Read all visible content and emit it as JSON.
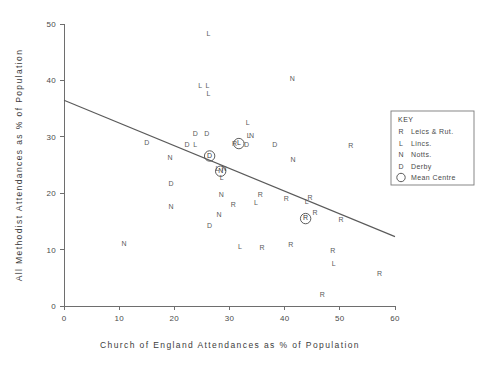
{
  "chart_data": {
    "type": "scatter",
    "title": "",
    "xlabel": "Church of England Attendances as % of Population",
    "ylabel": "All Methodist Attendances as % of Population",
    "xlim": [
      0,
      60
    ],
    "ylim": [
      0,
      50
    ],
    "xticks": [
      0,
      10,
      20,
      30,
      40,
      50,
      60
    ],
    "yticks": [
      0,
      10,
      20,
      30,
      40,
      50
    ],
    "grid": false,
    "legend_position": "right",
    "series": [
      {
        "name": "Leics & Rut.",
        "marker": "R",
        "points": [
          [
            30.9,
            28.7
          ],
          [
            52.0,
            28.3
          ],
          [
            35.6,
            19.6
          ],
          [
            40.3,
            19.0
          ],
          [
            44.6,
            19.1
          ],
          [
            30.7,
            17.8
          ],
          [
            45.5,
            16.4
          ],
          [
            50.2,
            15.2
          ],
          [
            41.1,
            10.8
          ],
          [
            35.9,
            10.2
          ],
          [
            48.7,
            9.8
          ],
          [
            57.2,
            5.6
          ],
          [
            46.8,
            1.9
          ]
        ]
      },
      {
        "name": "Lincs.",
        "marker": "L",
        "points": [
          [
            26.2,
            48.2
          ],
          [
            24.7,
            38.9
          ],
          [
            26.0,
            38.9
          ],
          [
            26.2,
            37.6
          ],
          [
            33.3,
            32.4
          ],
          [
            23.8,
            28.6
          ],
          [
            33.5,
            30.1
          ],
          [
            27.8,
            24.3
          ],
          [
            28.6,
            22.7
          ],
          [
            34.8,
            18.3
          ],
          [
            44.0,
            18.5
          ],
          [
            31.9,
            10.5
          ],
          [
            48.9,
            7.5
          ]
        ]
      },
      {
        "name": "Notts.",
        "marker": "N",
        "points": [
          [
            41.4,
            40.3
          ],
          [
            34.0,
            30.1
          ],
          [
            41.5,
            25.8
          ],
          [
            19.2,
            26.2
          ],
          [
            29.0,
            24.2
          ],
          [
            28.5,
            19.7
          ],
          [
            28.1,
            16.1
          ],
          [
            19.4,
            17.6
          ],
          [
            10.9,
            11.0
          ]
        ]
      },
      {
        "name": "Derby",
        "marker": "D",
        "points": [
          [
            23.8,
            30.4
          ],
          [
            25.9,
            30.4
          ],
          [
            15.0,
            28.9
          ],
          [
            22.3,
            28.6
          ],
          [
            33.1,
            28.5
          ],
          [
            38.2,
            28.5
          ],
          [
            19.4,
            21.6
          ],
          [
            26.4,
            14.1
          ]
        ]
      }
    ],
    "mean_centres": [
      {
        "label": "D",
        "x": 26.4,
        "y": 26.6,
        "series": "Derby"
      },
      {
        "label": "L",
        "x": 31.7,
        "y": 28.8,
        "series": "Lincs."
      },
      {
        "label": "N",
        "x": 28.4,
        "y": 23.9,
        "series": "Notts."
      },
      {
        "label": "R",
        "x": 43.8,
        "y": 15.5,
        "series": "Leics & Rut."
      }
    ],
    "trend_line": {
      "x1": 0,
      "y1": 36.5,
      "x2": 60,
      "y2": 12.3
    }
  },
  "key": {
    "title": "KEY",
    "entries": [
      {
        "symbol": "R",
        "label": "Leics & Rut."
      },
      {
        "symbol": "L",
        "label": "Lincs."
      },
      {
        "symbol": "N",
        "label": "Notts."
      },
      {
        "symbol": "D",
        "label": "Derby"
      },
      {
        "symbol": "circle",
        "label": "Mean Centre"
      }
    ]
  },
  "axis": {
    "x_tick_labels": [
      "0",
      "10",
      "20",
      "30",
      "40",
      "50",
      "60"
    ],
    "y_tick_labels": [
      "0",
      "10",
      "20",
      "30",
      "40",
      "50"
    ]
  },
  "colors": {
    "ink": "#4a4a4a",
    "axis": "#6e6e6e",
    "background": "#ffffff"
  }
}
